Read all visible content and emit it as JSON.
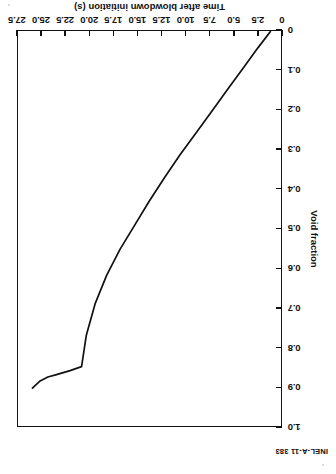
{
  "figure": {
    "identifier": "INEL-A-11 383",
    "orientation_note": "rotated-180"
  },
  "chart_data": {
    "type": "line",
    "title": "",
    "subtitle": "",
    "xlabel": "Time after blowdown initiation (s)",
    "ylabel": "Void fraction",
    "xlim": [
      0,
      27.5
    ],
    "ylim": [
      0,
      1.0
    ],
    "xticks": [
      0,
      2.5,
      5.0,
      7.5,
      10.0,
      12.5,
      15.0,
      17.5,
      20.0,
      22.5,
      25.0,
      27.5
    ],
    "xticklabels": [
      "0",
      "2.5",
      "5.0",
      "7.5",
      "10.0",
      "12.5",
      "15.0",
      "17.5",
      "20.0",
      "22.5",
      "25.0",
      "27.5"
    ],
    "yticks": [
      0,
      0.1,
      0.2,
      0.3,
      0.4,
      0.5,
      0.6,
      0.7,
      0.8,
      0.9,
      1.0
    ],
    "yticklabels": [
      "0",
      "0.1",
      "0.2",
      "0.3",
      "0.4",
      "0.5",
      "0.6",
      "0.7",
      "0.8",
      "0.9",
      "1.0"
    ],
    "grid": false,
    "legend": false,
    "legend_position": "none",
    "line_color": "#111111",
    "series": [
      {
        "name": "Void fraction",
        "x": [
          1.2,
          2.5,
          4.0,
          5.6,
          7.3,
          9.0,
          10.6,
          12.2,
          13.8,
          15.3,
          16.8,
          18.2,
          19.4,
          20.3,
          20.8,
          22.0,
          23.4,
          24.3,
          25.1,
          25.9
        ],
        "y": [
          0.004,
          0.045,
          0.095,
          0.148,
          0.205,
          0.262,
          0.315,
          0.372,
          0.432,
          0.492,
          0.552,
          0.618,
          0.69,
          0.768,
          0.848,
          0.858,
          0.868,
          0.874,
          0.884,
          0.902
        ]
      }
    ],
    "annotations": []
  }
}
